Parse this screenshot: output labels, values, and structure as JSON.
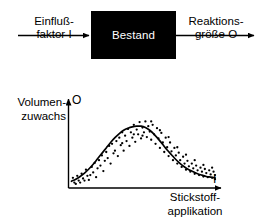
{
  "figure": {
    "background_color": "#ffffff",
    "ink_color": "#000000",
    "width": 264,
    "height": 220
  },
  "block_diagram": {
    "input_arrow": {
      "label_line1": "Einfluß-",
      "label_line2": "faktor I",
      "icon": "arrow-right-icon"
    },
    "system_box": {
      "label": "Bestand",
      "fill_color": "#000000",
      "text_color": "#ffffff"
    },
    "output_arrow": {
      "label_line1": "Reaktions-",
      "label_line2": "größe  O",
      "icon": "arrow-right-icon"
    }
  },
  "chart_labels": {
    "y_axis_line1": "Volumen-",
    "y_axis_line2": "zuwachs",
    "y_axis_symbol": "O",
    "x_axis_line1": "Stickstoff-",
    "x_axis_line2": "applikation",
    "x_axis_symbol": "I"
  },
  "chart_data": {
    "type": "scatter",
    "title": "",
    "xlabel": "Stickstoffapplikation",
    "ylabel": "Volumenzuwachs",
    "x_symbol": "I",
    "y_symbol": "O",
    "grid": false,
    "legend": false,
    "axes_style": "arrows",
    "xlim": [
      0,
      100
    ],
    "ylim": [
      0,
      100
    ],
    "tick_labels_x": [],
    "tick_labels_y": [],
    "fit_curve": {
      "name": "Ausgleichskurve",
      "shape": "bell",
      "peak_x": 47,
      "peak_y": 88,
      "points": [
        [
          1,
          7
        ],
        [
          4,
          10
        ],
        [
          7,
          14
        ],
        [
          10,
          19
        ],
        [
          13,
          25
        ],
        [
          16,
          32
        ],
        [
          19,
          40
        ],
        [
          22,
          48
        ],
        [
          25,
          56
        ],
        [
          28,
          64
        ],
        [
          31,
          71
        ],
        [
          34,
          77
        ],
        [
          37,
          82
        ],
        [
          40,
          85
        ],
        [
          43,
          87
        ],
        [
          46,
          88
        ],
        [
          49,
          88
        ],
        [
          52,
          86
        ],
        [
          55,
          82
        ],
        [
          58,
          76
        ],
        [
          61,
          69
        ],
        [
          64,
          61
        ],
        [
          67,
          53
        ],
        [
          70,
          46
        ],
        [
          73,
          39
        ],
        [
          76,
          33
        ],
        [
          79,
          28
        ],
        [
          82,
          24
        ],
        [
          85,
          21
        ],
        [
          88,
          18
        ],
        [
          91,
          16
        ],
        [
          94,
          14
        ],
        [
          97,
          13
        ],
        [
          100,
          12
        ]
      ]
    },
    "scatter_points": [
      [
        2,
        12
      ],
      [
        3,
        5
      ],
      [
        5,
        15
      ],
      [
        6,
        8
      ],
      [
        8,
        18
      ],
      [
        9,
        11
      ],
      [
        11,
        24
      ],
      [
        12,
        15
      ],
      [
        13,
        9
      ],
      [
        15,
        28
      ],
      [
        16,
        20
      ],
      [
        17,
        34
      ],
      [
        18,
        13
      ],
      [
        20,
        38
      ],
      [
        21,
        30
      ],
      [
        22,
        45
      ],
      [
        23,
        22
      ],
      [
        25,
        50
      ],
      [
        26,
        41
      ],
      [
        27,
        59
      ],
      [
        28,
        33
      ],
      [
        29,
        62
      ],
      [
        31,
        52
      ],
      [
        32,
        66
      ],
      [
        33,
        44
      ],
      [
        34,
        71
      ],
      [
        35,
        60
      ],
      [
        36,
        79
      ],
      [
        37,
        52
      ],
      [
        38,
        74
      ],
      [
        39,
        66
      ],
      [
        40,
        84
      ],
      [
        41,
        59
      ],
      [
        42,
        79
      ],
      [
        43,
        71
      ],
      [
        44,
        90
      ],
      [
        45,
        65
      ],
      [
        46,
        83
      ],
      [
        47,
        76
      ],
      [
        48,
        94
      ],
      [
        49,
        70
      ],
      [
        50,
        86
      ],
      [
        51,
        79
      ],
      [
        52,
        95
      ],
      [
        53,
        72
      ],
      [
        54,
        88
      ],
      [
        55,
        80
      ],
      [
        56,
        68
      ],
      [
        57,
        90
      ],
      [
        58,
        76
      ],
      [
        59,
        62
      ],
      [
        60,
        85
      ],
      [
        61,
        70
      ],
      [
        62,
        56
      ],
      [
        63,
        78
      ],
      [
        64,
        64
      ],
      [
        65,
        50
      ],
      [
        66,
        71
      ],
      [
        67,
        57
      ],
      [
        68,
        44
      ],
      [
        69,
        64
      ],
      [
        70,
        51
      ],
      [
        71,
        38
      ],
      [
        72,
        56
      ],
      [
        73,
        45
      ],
      [
        74,
        33
      ],
      [
        75,
        49
      ],
      [
        76,
        38
      ],
      [
        77,
        28
      ],
      [
        78,
        43
      ],
      [
        79,
        33
      ],
      [
        80,
        24
      ],
      [
        81,
        37
      ],
      [
        82,
        29
      ],
      [
        83,
        21
      ],
      [
        84,
        33
      ],
      [
        85,
        26
      ],
      [
        86,
        18
      ],
      [
        87,
        30
      ],
      [
        88,
        23
      ],
      [
        89,
        16
      ],
      [
        90,
        27
      ],
      [
        91,
        21
      ],
      [
        92,
        14
      ],
      [
        93,
        25
      ],
      [
        94,
        19
      ],
      [
        95,
        13
      ],
      [
        96,
        23
      ],
      [
        97,
        17
      ],
      [
        98,
        12
      ],
      [
        99,
        21
      ],
      [
        100,
        16
      ],
      [
        100,
        10
      ],
      [
        4,
        3
      ],
      [
        7,
        5
      ],
      [
        10,
        8
      ],
      [
        14,
        16
      ],
      [
        19,
        26
      ],
      [
        24,
        37
      ],
      [
        30,
        48
      ],
      [
        36,
        63
      ],
      [
        44,
        76
      ],
      [
        50,
        74
      ],
      [
        56,
        95
      ],
      [
        62,
        82
      ],
      [
        68,
        72
      ],
      [
        74,
        57
      ],
      [
        80,
        46
      ],
      [
        86,
        38
      ],
      [
        92,
        31
      ],
      [
        98,
        27
      ]
    ]
  }
}
